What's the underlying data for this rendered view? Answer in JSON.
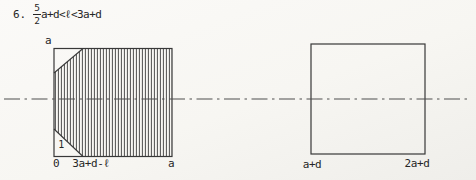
{
  "problem": {
    "number": "6.",
    "fraction": {
      "numerator": "5",
      "denominator": "2"
    },
    "expression": "a+d<ℓ<3a+d"
  },
  "left_figure": {
    "top_left_label": "a",
    "origin_label": "0",
    "bottom_mid_label": "3a+d-ℓ",
    "bottom_right_label": "a",
    "triangle_label": "1"
  },
  "right_figure": {
    "bottom_left_label": "a+d",
    "bottom_right_label": "2a+d"
  },
  "colors": {
    "ink": "#383838",
    "centerline": "#4f4f4f",
    "paper": "#f7f6f2"
  }
}
